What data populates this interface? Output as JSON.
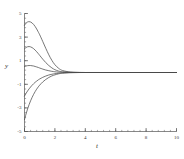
{
  "figure": {
    "background": "#ffffff",
    "curve_color": "#4a4a4a",
    "axis_color": "#555555"
  },
  "axes": {
    "xlabel": "t",
    "ylabel": "y",
    "x_ticklabels": [
      "0",
      "2",
      "4",
      "6",
      "8",
      "10"
    ],
    "y_ticklabels": [
      "5",
      "3",
      "1",
      "-1",
      "-3",
      "-5"
    ]
  },
  "chart_data": {
    "type": "line",
    "title": "",
    "xlabel": "t",
    "ylabel": "y",
    "xlim": [
      0,
      10
    ],
    "ylim": [
      -5,
      5
    ],
    "xticks": [
      0,
      2,
      4,
      6,
      8,
      10
    ],
    "yticks": [
      5,
      3,
      1,
      -1,
      -3,
      -5
    ],
    "x_minor_tick_step": 0.4,
    "y_minor_tick_step": 0.4,
    "grid": false,
    "legend": null,
    "equilibrium": 0,
    "x": [
      0,
      0.1,
      0.2,
      0.3,
      0.4,
      0.5,
      0.6,
      0.7,
      0.8,
      0.9,
      1.0,
      1.2,
      1.4,
      1.6,
      1.8,
      2.0,
      2.25,
      2.5,
      3.0,
      3.5,
      4.0,
      5.0,
      6.0,
      7.0,
      8.0,
      9.0,
      10.0
    ],
    "series": [
      {
        "name": "y0 = 4",
        "y0": 4,
        "values": [
          4.0,
          4.18,
          4.28,
          4.31,
          4.28,
          4.2,
          4.07,
          3.9,
          3.69,
          3.45,
          3.2,
          2.63,
          2.05,
          1.5,
          1.03,
          0.66,
          0.35,
          0.17,
          0.04,
          0.01,
          0.0,
          0.0,
          0.0,
          0.0,
          0.0,
          0.0,
          0.0
        ]
      },
      {
        "name": "y0 = 2",
        "y0": 2,
        "values": [
          2.0,
          2.12,
          2.18,
          2.2,
          2.17,
          2.11,
          2.02,
          1.9,
          1.76,
          1.61,
          1.45,
          1.13,
          0.84,
          0.59,
          0.39,
          0.24,
          0.12,
          0.06,
          0.015,
          0.004,
          0.0,
          0.0,
          0.0,
          0.0,
          0.0,
          0.0,
          0.0
        ]
      },
      {
        "name": "y0 = 0.5",
        "y0": 0.5,
        "values": [
          0.5,
          0.55,
          0.58,
          0.59,
          0.59,
          0.57,
          0.55,
          0.51,
          0.47,
          0.43,
          0.38,
          0.29,
          0.21,
          0.15,
          0.1,
          0.06,
          0.03,
          0.015,
          0.004,
          0.001,
          0.0,
          0.0,
          0.0,
          0.0,
          0.0,
          0.0,
          0.0
        ]
      },
      {
        "name": "y0 = -2",
        "y0": -2,
        "values": [
          -2.0,
          -1.77,
          -1.57,
          -1.39,
          -1.23,
          -1.08,
          -0.95,
          -0.83,
          -0.73,
          -0.63,
          -0.55,
          -0.41,
          -0.3,
          -0.21,
          -0.15,
          -0.1,
          -0.06,
          -0.03,
          -0.008,
          -0.002,
          0.0,
          0.0,
          0.0,
          0.0,
          0.0,
          0.0,
          0.0
        ]
      },
      {
        "name": "y0 = -4",
        "y0": -4,
        "values": [
          -4.0,
          -3.52,
          -3.1,
          -2.73,
          -2.4,
          -2.11,
          -1.85,
          -1.62,
          -1.41,
          -1.23,
          -1.07,
          -0.8,
          -0.59,
          -0.42,
          -0.29,
          -0.2,
          -0.11,
          -0.06,
          -0.015,
          -0.004,
          0.0,
          0.0,
          0.0,
          0.0,
          0.0,
          0.0,
          0.0
        ]
      }
    ]
  }
}
